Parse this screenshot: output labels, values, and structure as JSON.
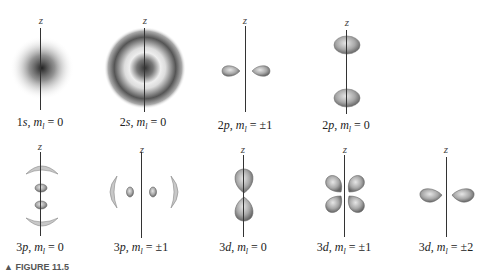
{
  "figure": {
    "axis_label": "z",
    "caption_fragment": "▲ FIGURE 11.5",
    "panels": [
      {
        "id": "1s_m0",
        "label": "1s, m_l = 0",
        "n": 1,
        "l": "s",
        "ml": "0"
      },
      {
        "id": "2s_m0",
        "label": "2s, m_l = 0",
        "n": 2,
        "l": "s",
        "ml": "0"
      },
      {
        "id": "2p_m1",
        "label": "2p, m_l = ±1",
        "n": 2,
        "l": "p",
        "ml": "±1"
      },
      {
        "id": "2p_m0",
        "label": "2p, m_l = 0",
        "n": 2,
        "l": "p",
        "ml": "0"
      },
      {
        "id": "3p_m0",
        "label": "3p, m_l = 0",
        "n": 3,
        "l": "p",
        "ml": "0"
      },
      {
        "id": "3p_m1",
        "label": "3p, m_l = ±1",
        "n": 3,
        "l": "p",
        "ml": "±1"
      },
      {
        "id": "3d_m0",
        "label": "3d, m_l = 0",
        "n": 3,
        "l": "d",
        "ml": "0"
      },
      {
        "id": "3d_m1",
        "label": "3d, m_l = ±1",
        "n": 3,
        "l": "d",
        "ml": "±1"
      },
      {
        "id": "3d_m2",
        "label": "3d, m_l = ±2",
        "n": 3,
        "l": "d",
        "ml": "±2"
      }
    ]
  }
}
